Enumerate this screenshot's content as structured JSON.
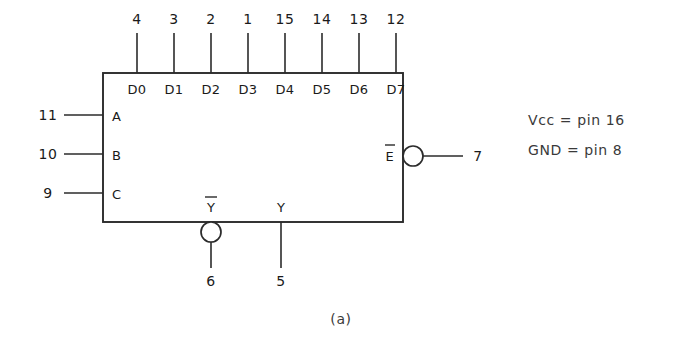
{
  "figure": {
    "caption": "(a)",
    "device_role": "8-input multiplexer logic symbol"
  },
  "data_inputs": {
    "labels": [
      "D0",
      "D1",
      "D2",
      "D3",
      "D4",
      "D5",
      "D6",
      "D7"
    ],
    "pin_numbers": [
      "4",
      "3",
      "2",
      "1",
      "15",
      "14",
      "13",
      "12"
    ]
  },
  "select_inputs": {
    "labels": [
      "A",
      "B",
      "C"
    ],
    "pin_numbers": [
      "11",
      "10",
      "9"
    ]
  },
  "enable_input": {
    "label": "E",
    "overbar": true,
    "pin_number": "7",
    "active_low": true
  },
  "outputs": [
    {
      "label": "Y",
      "overbar": true,
      "pin_number": "6",
      "inverted": true
    },
    {
      "label": "Y",
      "overbar": false,
      "pin_number": "5",
      "inverted": false
    }
  ],
  "power_notes": [
    "Vcc = pin 16",
    "GND = pin 8"
  ],
  "colors": {
    "ink": "#1a1a1a",
    "line": "#2b2b2b",
    "note": "#3a3a3a",
    "background": "#ffffff"
  }
}
